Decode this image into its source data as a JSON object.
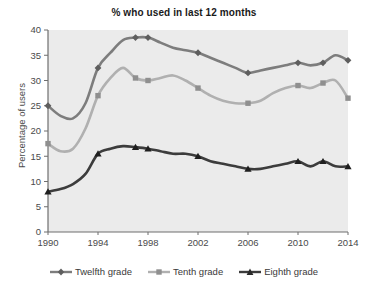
{
  "chart_data": {
    "type": "line",
    "title": "% who used in last 12 months",
    "xlabel": "",
    "ylabel": "Percentage of users",
    "xlim": [
      1990,
      2014
    ],
    "ylim": [
      0,
      40
    ],
    "ytick_step": 5,
    "xtick_step": 4,
    "grid": false,
    "legend_position": "bottom",
    "ytick_labels": [
      "0",
      "5",
      "10",
      "15",
      "20",
      "25",
      "30",
      "35",
      "40"
    ],
    "xtick_labels": [
      "1990",
      "1994",
      "1998",
      "2002",
      "2006",
      "2010",
      "2014"
    ],
    "x": [
      1990,
      1991,
      1992,
      1993,
      1994,
      1995,
      1996,
      1997,
      1998,
      1999,
      2000,
      2001,
      2002,
      2003,
      2004,
      2005,
      2006,
      2007,
      2008,
      2009,
      2010,
      2011,
      2012,
      2013,
      2014
    ],
    "series": [
      {
        "name": "Twelfth grade",
        "marker": "diamond",
        "color": "#7d7d7d",
        "values": [
          25.0,
          23.0,
          22.5,
          25.5,
          32.5,
          35.5,
          38.0,
          38.5,
          38.5,
          37.5,
          36.5,
          36.0,
          35.5,
          34.5,
          33.5,
          32.5,
          31.5,
          32.0,
          32.5,
          33.0,
          33.5,
          33.0,
          33.5,
          35.0,
          34.0
        ]
      },
      {
        "name": "Tenth grade",
        "marker": "square",
        "color": "#b0b0b0",
        "values": [
          17.5,
          16.0,
          16.5,
          20.5,
          27.0,
          30.5,
          32.5,
          30.5,
          30.0,
          30.5,
          31.0,
          30.0,
          28.5,
          27.0,
          26.0,
          25.5,
          25.5,
          26.0,
          27.5,
          28.5,
          29.0,
          28.5,
          29.5,
          30.0,
          26.5
        ]
      },
      {
        "name": "Eighth grade",
        "marker": "triangle",
        "color": "#3c3c3c",
        "values": [
          8.0,
          8.5,
          9.5,
          11.5,
          15.5,
          16.5,
          17.0,
          16.8,
          16.5,
          16.0,
          15.5,
          15.5,
          15.0,
          14.0,
          13.5,
          13.0,
          12.5,
          12.5,
          13.0,
          13.5,
          14.0,
          13.0,
          14.0,
          13.0,
          13.0
        ]
      }
    ]
  },
  "legend": {
    "items": [
      {
        "label": "Twelfth grade"
      },
      {
        "label": "Tenth grade"
      },
      {
        "label": "Eighth grade"
      }
    ]
  },
  "colors": {
    "plot_background": "#ebebeb",
    "axis": "#6e6e6e",
    "text": "#4a4a4a",
    "title": "#1a1a1a"
  }
}
